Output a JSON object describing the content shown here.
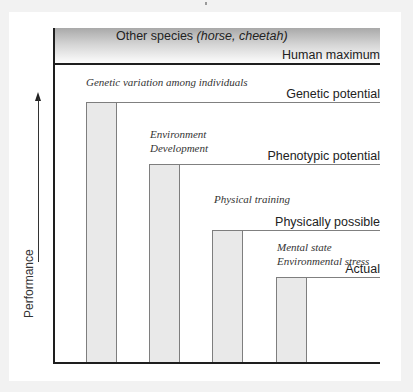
{
  "diagram": {
    "species_box": {
      "label_prefix": "Other species ",
      "label_italic": "(horse, cheetah)"
    },
    "levels": [
      {
        "label": "Human maximum"
      },
      {
        "label": "Genetic potential"
      },
      {
        "label": "Phenotypic potential"
      },
      {
        "label": "Physically possible"
      },
      {
        "label": "Actual"
      }
    ],
    "annotations": [
      {
        "lines": [
          "Genetic variation among individuals"
        ]
      },
      {
        "lines": [
          "Environment",
          "Development"
        ]
      },
      {
        "lines": [
          "Physical training"
        ]
      },
      {
        "lines": [
          "Mental state",
          "Environmental stress"
        ]
      }
    ],
    "y_axis_label": "Performance",
    "bars": [
      {
        "name": "Genetic potential",
        "relative_height": 261
      },
      {
        "name": "Phenotypic potential",
        "relative_height": 199
      },
      {
        "name": "Physically possible",
        "relative_height": 133
      },
      {
        "name": "Actual",
        "relative_height": 86
      }
    ],
    "colors": {
      "bar_fill": "#e9e9e9",
      "bar_outline": "#7e7e7e",
      "axis": "#1e1e1e",
      "species_gradient_top": "#a9a9a9"
    }
  }
}
